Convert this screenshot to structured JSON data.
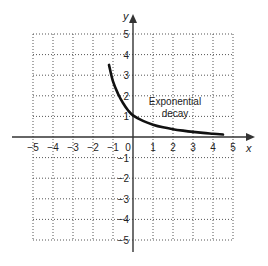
{
  "chart_data": {
    "type": "line",
    "title": "",
    "xlabel": "x",
    "ylabel": "y",
    "xlim": [
      -5,
      5
    ],
    "ylim": [
      -5,
      5
    ],
    "grid": true,
    "grid_style": "dotted",
    "x_ticks": [
      "-5",
      "-4",
      "-3",
      "-2",
      "-1",
      "0",
      "1",
      "2",
      "3",
      "4",
      "5"
    ],
    "y_ticks": [
      "5",
      "4",
      "3",
      "2",
      "1",
      "-1",
      "-2",
      "-3",
      "-4",
      "-5"
    ],
    "series": [
      {
        "name": "Exponential decay",
        "x": [
          -1.2,
          -1.0,
          -0.75,
          -0.5,
          -0.25,
          0,
          0.5,
          1,
          1.5,
          2,
          2.5,
          3,
          3.5,
          4,
          4.5
        ],
        "y": [
          3.5,
          2.7,
          2.1,
          1.65,
          1.3,
          1.05,
          0.78,
          0.6,
          0.47,
          0.38,
          0.31,
          0.25,
          0.2,
          0.16,
          0.12
        ]
      }
    ],
    "annotations": [
      {
        "text_line1": "Exponential",
        "text_line2": "decay",
        "x": 2.1,
        "y": 1.3
      }
    ],
    "colors": {
      "curve": "#111111",
      "axis": "#333333",
      "grid": "#555555"
    }
  }
}
